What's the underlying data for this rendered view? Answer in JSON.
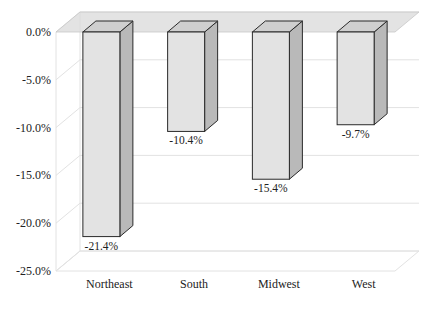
{
  "chart_data": {
    "type": "bar",
    "style": "3d-column",
    "title": "",
    "xlabel": "",
    "ylabel": "",
    "categories": [
      "Northeast",
      "South",
      "Midwest",
      "West"
    ],
    "values": [
      -21.4,
      -10.4,
      -15.4,
      -9.7
    ],
    "value_labels": [
      "-21.4%",
      "-10.4%",
      "-15.4%",
      "-9.7%"
    ],
    "ylim": [
      -25,
      0
    ],
    "yticks": [
      0,
      -5,
      -10,
      -15,
      -20,
      -25
    ],
    "ytick_labels": [
      "0.0%",
      "-5.0%",
      "-10.0%",
      "-15.0%",
      "-20.0%",
      "-25.0%"
    ],
    "grid": true,
    "legend": null
  },
  "colors": {
    "bar_front": "#e3e3e3",
    "bar_side": "#b9b9b9",
    "bar_top": "#cfcfcf",
    "bar_edge": "#2a2a2a",
    "plane": "#d9d9d9",
    "grid": "#e2e2e2"
  }
}
